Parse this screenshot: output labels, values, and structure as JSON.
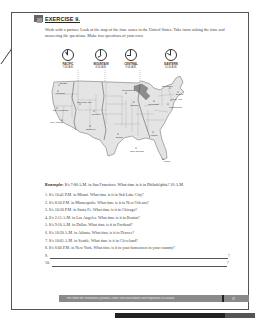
{
  "exercise": {
    "title": "EXERCISE 9.",
    "instructions": "Work with a partner. Look at the map of the time zones in the United States. Take turns asking the time and answering the questions. Make two questions of your own."
  },
  "clocks": [
    {
      "zone": "PACIFIC",
      "time": "7:00 A.M."
    },
    {
      "zone": "MOUNTAIN",
      "time": "8:00 A.M."
    },
    {
      "zone": "CENTRAL",
      "time": "9:00 A.M."
    },
    {
      "zone": "EASTERN",
      "time": "10:00 A.M."
    }
  ],
  "map": {
    "cities": [
      "Seattle",
      "Portland",
      "San Francisco",
      "Los Angeles",
      "Salt Lake City",
      "Denver",
      "Santa Fe",
      "Dallas",
      "Minneapolis",
      "Chicago",
      "New Orleans",
      "Atlanta",
      "Miami",
      "Cleveland",
      "Philadelphia",
      "New York",
      "Boston",
      "Burlington"
    ]
  },
  "example": {
    "label": "Example:",
    "text": "It's 7:00 A.M. in San Francisco. What time is it in Philadelphia? 10 A.M."
  },
  "questions": [
    "1. It's 10:45 P.M. in Miami. What time is it in Salt Lake City?",
    "2. It's 8:50 P.M. in Minneapolis. What time is it in New Orleans?",
    "3. It's 10:30 P.M. in Santa Fe. What time is it in Chicago?",
    "4. It's 2:15 A.M. in Los Angeles. What time is it in Boston?",
    "5. It's 9:10 A.M. in Dallas. What time is it in Portland?",
    "6. It's 10:20 A.M. in Atlanta. What time is it in Denver?",
    "7. It's 10:05 A.M. in Seattle. What time is it in Cleveland?",
    "8. It's 6:00 P.M. in New York. What time is it in your hometown in your country?"
  ],
  "blanks": [
    {
      "number": "9.",
      "end": "?"
    },
    {
      "number": "10.",
      "end": "?"
    }
  ],
  "footer": {
    "text": "THE VERB BE: Information Questions, It with Time and Weather, and Prepositions of Location",
    "page": "37"
  }
}
